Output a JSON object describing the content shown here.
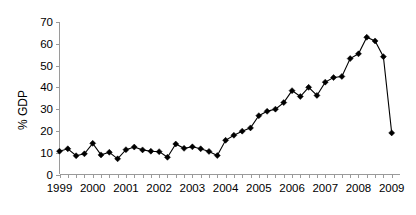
{
  "chart_data": {
    "type": "line",
    "title": "",
    "xlabel": "",
    "ylabel": "% GDP",
    "ylim": [
      0,
      70
    ],
    "ytick_values": [
      0,
      10,
      20,
      30,
      40,
      50,
      60,
      70
    ],
    "ytick_labels": [
      "0",
      "10",
      "20",
      "30",
      "40",
      "50",
      "60",
      "70"
    ],
    "xlim": [
      1999.0,
      2009.25
    ],
    "xtick_values": [
      1999,
      2000,
      2001,
      2002,
      2003,
      2004,
      2005,
      2006,
      2007,
      2008,
      2009
    ],
    "xtick_labels": [
      "1999",
      "2000",
      "2001",
      "2002",
      "2003",
      "2004",
      "2005",
      "2006",
      "2007",
      "2008",
      "2009"
    ],
    "grid": false,
    "legend": null,
    "marker": "diamond",
    "marker_color": "#000000",
    "line_color": "#000000",
    "frequency": "quarterly",
    "x": [
      1999.0,
      1999.25,
      1999.5,
      1999.75,
      2000.0,
      2000.25,
      2000.5,
      2000.75,
      2001.0,
      2001.25,
      2001.5,
      2001.75,
      2002.0,
      2002.25,
      2002.5,
      2002.75,
      2003.0,
      2003.25,
      2003.5,
      2003.75,
      2004.0,
      2004.25,
      2004.5,
      2004.75,
      2005.0,
      2005.25,
      2005.5,
      2005.75,
      2006.0,
      2006.25,
      2006.5,
      2006.75,
      2007.0,
      2007.25,
      2007.5,
      2007.75,
      2008.0,
      2008.25,
      2008.5,
      2008.75,
      2009.0
    ],
    "values": [
      10.7,
      11.8,
      8.6,
      9.5,
      14.3,
      9.0,
      10.2,
      7.2,
      11.4,
      12.6,
      11.3,
      10.7,
      10.5,
      7.9,
      14.0,
      12.0,
      12.7,
      11.8,
      10.6,
      8.7,
      15.7,
      18.0,
      19.9,
      21.4,
      27.0,
      29.0,
      30.0,
      33.0,
      38.5,
      35.8,
      40.0,
      36.3,
      42.4,
      44.5,
      45.0,
      53.2,
      55.4,
      63.0,
      61.3,
      54.1,
      19.1
    ]
  }
}
